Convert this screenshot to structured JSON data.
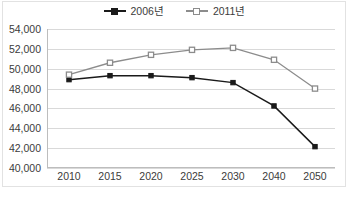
{
  "chart_data": {
    "type": "line",
    "title": "",
    "subtitle": "",
    "xlabel": "",
    "ylabel": "",
    "categories": [
      "2010",
      "2015",
      "2020",
      "2025",
      "2030",
      "2040",
      "2050"
    ],
    "x": [
      2010,
      2015,
      2020,
      2025,
      2030,
      2040,
      2050
    ],
    "ylim": [
      40000,
      54000
    ],
    "y_ticks": [
      54000,
      52000,
      50000,
      48000,
      46000,
      44000,
      42000,
      40000
    ],
    "y_tick_labels": [
      "54,000",
      "52,000",
      "50,000",
      "48,000",
      "46,000",
      "44,000",
      "42,000",
      "40,000"
    ],
    "y_tick_interval": 2000,
    "x_tick_labels": [
      "2010",
      "2015",
      "2020",
      "2025",
      "2030",
      "2040",
      "2050"
    ],
    "grid": "horizontal",
    "legend_position": "top-center",
    "series": [
      {
        "name": "2006년",
        "color": "#1a1a1a",
        "marker": "filled-square",
        "values": [
          48900,
          49300,
          49300,
          49100,
          48600,
          46250,
          42150
        ]
      },
      {
        "name": "2011년",
        "color": "#8c8c8c",
        "marker": "open-square",
        "values": [
          49400,
          50600,
          51400,
          51900,
          52100,
          50900,
          48000
        ]
      }
    ]
  },
  "legend": {
    "items": [
      {
        "label": "2006년",
        "key_name": "legend-key-2006"
      },
      {
        "label": "2011년",
        "key_name": "legend-key-2011"
      }
    ]
  },
  "caption": {
    "text": ""
  }
}
